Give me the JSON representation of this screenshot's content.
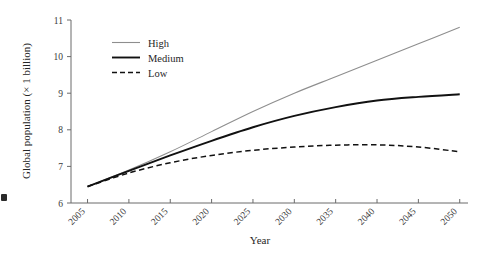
{
  "chart_data": {
    "type": "line",
    "title": "",
    "xlabel": "Year",
    "ylabel": "Global population (× 1 billion)",
    "x": [
      2005,
      2010,
      2015,
      2020,
      2025,
      2030,
      2035,
      2040,
      2045,
      2050
    ],
    "xtick_labels": [
      "2005",
      "2010",
      "2015",
      "2020",
      "2025",
      "2030",
      "2035",
      "2040",
      "2045",
      "2050"
    ],
    "ytick_labels": [
      "6",
      "7",
      "8",
      "9",
      "10",
      "11"
    ],
    "ytick_values": [
      6,
      7,
      8,
      9,
      10,
      11
    ],
    "xlim": [
      2003,
      2051
    ],
    "ylim": [
      6,
      11
    ],
    "grid": false,
    "legend_position": "top-left-inside",
    "series": [
      {
        "name": "High",
        "style": "solid-thin-gray",
        "color": "#8e8e8e",
        "values": [
          6.45,
          6.9,
          7.4,
          7.95,
          8.5,
          9.0,
          9.45,
          9.9,
          10.35,
          10.8
        ]
      },
      {
        "name": "Medium",
        "style": "solid-thick-black",
        "color": "#111111",
        "values": [
          6.45,
          6.88,
          7.3,
          7.7,
          8.07,
          8.38,
          8.62,
          8.8,
          8.9,
          8.97
        ]
      },
      {
        "name": "Low",
        "style": "dashed-black",
        "color": "#111111",
        "values": [
          6.45,
          6.82,
          7.1,
          7.3,
          7.44,
          7.53,
          7.58,
          7.59,
          7.53,
          7.4
        ]
      }
    ]
  },
  "legend": {
    "entries": [
      {
        "label": "High"
      },
      {
        "label": "Medium"
      },
      {
        "label": "Low"
      }
    ]
  },
  "axes": {
    "x_title": "Year",
    "y_title": "Global population (× 1 billion)"
  }
}
